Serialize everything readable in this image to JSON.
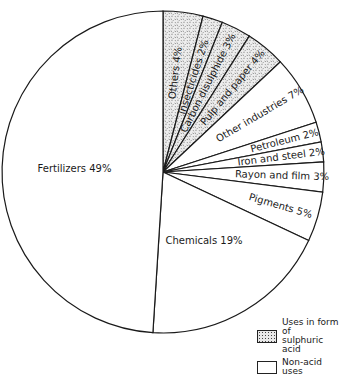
{
  "chart_data": {
    "type": "pie",
    "title": "",
    "start_angle_deg": 0,
    "direction": "clockwise",
    "slices": [
      {
        "label": "Others",
        "value": 4,
        "display": "Others 4%",
        "group": "acid"
      },
      {
        "label": "Insecticides",
        "value": 2,
        "display": "Insecticides 2%",
        "group": "acid"
      },
      {
        "label": "Carbon disulphide",
        "value": 3,
        "display": "Carbon disulphide 3%",
        "group": "acid"
      },
      {
        "label": "Pulp and paper",
        "value": 4,
        "display": "Pulp and paper 4%",
        "group": "acid"
      },
      {
        "label": "Other industries",
        "value": 7,
        "display": "Other industries 7%",
        "group": "nonacid"
      },
      {
        "label": "Petroleum",
        "value": 2,
        "display": "Petroleum 2%",
        "group": "nonacid"
      },
      {
        "label": "Iron and steel",
        "value": 2,
        "display": "Iron and steel 2%",
        "group": "nonacid"
      },
      {
        "label": "Rayon and film",
        "value": 3,
        "display": "Rayon and film 3%",
        "group": "nonacid"
      },
      {
        "label": "Pigments",
        "value": 5,
        "display": "Pigments 5%",
        "group": "nonacid"
      },
      {
        "label": "Chemicals",
        "value": 19,
        "display": "Chemicals 19%",
        "group": "nonacid"
      },
      {
        "label": "Fertilizers",
        "value": 49,
        "display": "Fertilizers 49%",
        "group": "nonacid"
      }
    ],
    "legend": [
      {
        "key": "acid",
        "label_line1": "Uses in form of",
        "label_line2": "sulphuric acid"
      },
      {
        "key": "nonacid",
        "label_line1": "Non-acid uses",
        "label_line2": ""
      }
    ],
    "legend_position": "bottom-right",
    "colors": {
      "outline": "#1a1a1a",
      "acid_fill": "#e6e6e6",
      "nonacid_fill": "#ffffff"
    }
  }
}
